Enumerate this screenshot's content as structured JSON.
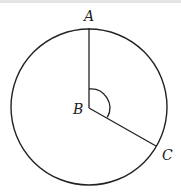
{
  "diagram": {
    "type": "circle-with-central-angle",
    "colors": {
      "stroke": "#222222",
      "background": "#ffffff"
    },
    "circle": {
      "cx": 89,
      "cy": 107,
      "r": 78
    },
    "points": {
      "A": {
        "label": "A",
        "x": 89,
        "y": 28
      },
      "B": {
        "label": "B",
        "x": 89,
        "y": 108
      },
      "C": {
        "label": "C",
        "x": 156,
        "y": 146
      }
    },
    "segments": [
      {
        "from": "B",
        "to": "A"
      },
      {
        "from": "B",
        "to": "C"
      }
    ],
    "angle_mark": {
      "vertex": "B",
      "between": [
        "A",
        "C"
      ]
    }
  }
}
